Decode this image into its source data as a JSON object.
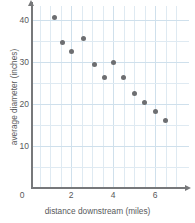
{
  "chart_data": {
    "type": "scatter",
    "title": "",
    "xlabel": "distance downstream (miles)",
    "ylabel": "average diameter (inches)",
    "xlim": [
      0,
      7.4
    ],
    "ylim": [
      0,
      43.5
    ],
    "xticks": [
      0,
      2,
      4,
      6
    ],
    "yticks": [
      10,
      20,
      30,
      40
    ],
    "xtick_labels": [
      "0",
      "2",
      "4",
      "6"
    ],
    "ytick_labels": [
      "10",
      "20",
      "30",
      "40"
    ],
    "grid": true,
    "grid_minor_spacing_x": 0.5,
    "grid_minor_spacing_y": 5,
    "legend": "none",
    "marker_color": "#6d6e71",
    "grid_color": "#dfeaf2",
    "axis_color": "#77787a",
    "points": [
      {
        "x": 1.2,
        "y": 40.5
      },
      {
        "x": 1.6,
        "y": 34.6
      },
      {
        "x": 2.0,
        "y": 32.6
      },
      {
        "x": 2.6,
        "y": 35.5
      },
      {
        "x": 3.1,
        "y": 29.5
      },
      {
        "x": 3.6,
        "y": 26.2
      },
      {
        "x": 4.0,
        "y": 30.0
      },
      {
        "x": 4.5,
        "y": 26.3
      },
      {
        "x": 5.0,
        "y": 22.6
      },
      {
        "x": 5.5,
        "y": 20.4
      },
      {
        "x": 6.0,
        "y": 18.2
      },
      {
        "x": 6.5,
        "y": 16.1
      }
    ]
  }
}
